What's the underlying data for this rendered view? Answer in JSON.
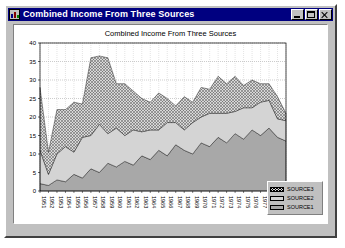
{
  "window": {
    "title": "Combined Income From Three Sources",
    "icon": "chart-app-icon",
    "buttons": [
      {
        "name": "minimize-button",
        "label": "Minimize"
      },
      {
        "name": "maximize-button",
        "label": "Maximize"
      },
      {
        "name": "close-button",
        "label": "Close"
      }
    ]
  },
  "legend": {
    "items": [
      {
        "label": "SOURCE3",
        "color": "#d8d8d8",
        "pattern": "crosshatch"
      },
      {
        "label": "SOURCE2",
        "color": "#d4d4d4",
        "pattern": "solid"
      },
      {
        "label": "SOURCE1",
        "color": "#a8a8a8",
        "pattern": "solid"
      }
    ]
  },
  "chart_data": {
    "type": "area",
    "stacked": true,
    "title": "Combined Income From Three Sources",
    "xlabel": "",
    "ylabel": "",
    "ylim": [
      0,
      40
    ],
    "yticks": [
      0,
      5,
      10,
      15,
      20,
      25,
      30,
      35,
      40
    ],
    "grid": true,
    "legend_position": "bottom-right-outside",
    "categories": [
      "1951",
      "1952",
      "1953",
      "1954",
      "1955",
      "1956",
      "1957",
      "1958",
      "1959",
      "1960",
      "1961",
      "1962",
      "1963",
      "1964",
      "1965",
      "1966",
      "1967",
      "1968",
      "1969",
      "1970",
      "1971",
      "1972",
      "1973",
      "1974",
      "1975",
      "1976",
      "1977",
      "1978",
      "1979",
      "1980"
    ],
    "series": [
      {
        "name": "SOURCE1",
        "color": "#a8a8a8",
        "pattern": "solid",
        "values": [
          2.0,
          1.5,
          3.0,
          2.5,
          4.5,
          3.5,
          6.0,
          5.0,
          7.5,
          6.5,
          8.0,
          7.0,
          9.5,
          8.5,
          11.0,
          9.5,
          12.5,
          11.0,
          10.0,
          13.0,
          12.0,
          14.5,
          13.0,
          15.5,
          14.0,
          16.5,
          15.0,
          17.0,
          14.5,
          13.5
        ]
      },
      {
        "name": "SOURCE2",
        "color": "#d4d4d4",
        "pattern": "solid",
        "values": [
          9.0,
          3.0,
          7.0,
          9.5,
          6.0,
          11.0,
          9.0,
          13.0,
          8.0,
          10.5,
          7.0,
          9.5,
          6.5,
          8.0,
          5.5,
          9.0,
          6.0,
          5.5,
          8.5,
          7.0,
          9.0,
          6.5,
          8.0,
          6.0,
          8.5,
          6.0,
          9.0,
          7.5,
          5.0,
          5.5
        ]
      },
      {
        "name": "SOURCE3",
        "color": "#d8d8d8",
        "pattern": "crosshatch",
        "values": [
          17.0,
          6.0,
          12.0,
          10.0,
          13.5,
          9.0,
          21.0,
          18.5,
          20.5,
          12.0,
          14.0,
          10.5,
          9.0,
          7.5,
          10.0,
          6.5,
          4.5,
          9.0,
          5.5,
          8.0,
          6.5,
          10.0,
          8.0,
          9.5,
          6.0,
          7.5,
          5.0,
          4.5,
          6.0,
          2.0
        ]
      }
    ]
  }
}
